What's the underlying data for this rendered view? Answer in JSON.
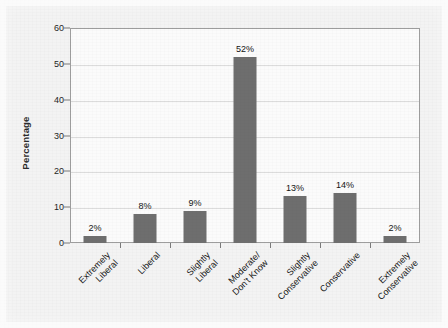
{
  "chart_data": {
    "type": "bar",
    "title": "",
    "subtitle": "",
    "xlabel": "",
    "ylabel": "Percentage",
    "ylim": [
      0,
      60
    ],
    "yticks": [
      0,
      10,
      20,
      30,
      40,
      50,
      60
    ],
    "grid": true,
    "legend": false,
    "categories": [
      "Extremely Liberal",
      "Liberal",
      "Slightly Liberal",
      "Moderate/ Don't Know",
      "Slightly Conservative",
      "Conservative",
      "Extremely Conservative"
    ],
    "category_lines": [
      [
        "Extremely",
        "Liberal"
      ],
      [
        "Liberal"
      ],
      [
        "Slightly",
        "Liberal"
      ],
      [
        "Moderate/",
        "Don't Know"
      ],
      [
        "Slightly",
        "Conservative"
      ],
      [
        "Conservative"
      ],
      [
        "Extremely",
        "Conservative"
      ]
    ],
    "values": [
      2,
      8,
      9,
      52,
      13,
      14,
      2
    ],
    "value_labels": [
      "2%",
      "8%",
      "9%",
      "52%",
      "13%",
      "14%",
      "2%"
    ],
    "bar_color": "#6e6e6e",
    "plot_background": "#fbfbfb",
    "canvas_background": "#f3f3f3",
    "gridline_color": "#dcdcdc",
    "axis_color": "#9d9d9d"
  }
}
